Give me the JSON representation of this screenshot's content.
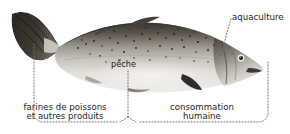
{
  "figure": {
    "background_color": "#ffffff",
    "text_color": "#1d1d1b",
    "leader_line_color": "#6e6e6e"
  },
  "labels": {
    "aquaculture": "aquaculture",
    "peche": "pêche",
    "farines_line1": "farines de poissons",
    "farines_line2": "et autres produits",
    "consommation_line1": "consommation",
    "consommation_line2": "humaine"
  },
  "callouts": [
    {
      "name": "aquaculture",
      "text": "aquaculture",
      "target": "fish head",
      "style": "dotted diagonal leader"
    },
    {
      "name": "peche",
      "text": "pêche",
      "target": "fish mid-body",
      "style": "dotted vertical leader"
    },
    {
      "name": "farines-de-poissons",
      "text": "farines de poissons et autres produits",
      "target": "tail half of fish",
      "style": "dotted bracket"
    },
    {
      "name": "consommation-humaine",
      "text": "consommation humaine",
      "target": "head half of fish",
      "style": "dotted bracket"
    }
  ]
}
